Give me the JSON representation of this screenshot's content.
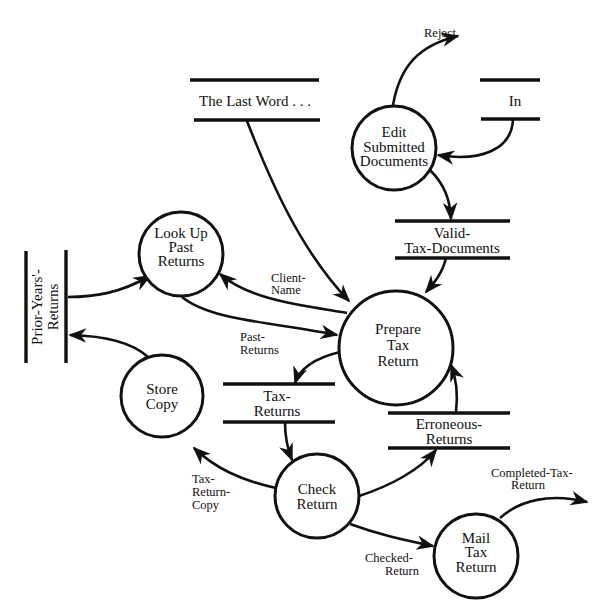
{
  "diagram": {
    "type": "data-flow-diagram",
    "processes": [
      {
        "id": "edit",
        "lines": [
          "Edit",
          "Submitted",
          "Documents"
        ]
      },
      {
        "id": "lookup",
        "lines": [
          "Look Up",
          "Past",
          "Returns"
        ]
      },
      {
        "id": "prepare",
        "lines": [
          "Prepare",
          "Tax",
          "Return"
        ]
      },
      {
        "id": "store",
        "lines": [
          "Store",
          "Copy"
        ]
      },
      {
        "id": "check",
        "lines": [
          "Check",
          "Return"
        ]
      },
      {
        "id": "mail",
        "lines": [
          "Mail",
          "Tax",
          "Return"
        ]
      }
    ],
    "stores": [
      {
        "id": "lastword",
        "lines": [
          "The Last Word . . ."
        ]
      },
      {
        "id": "in",
        "lines": [
          "In"
        ]
      },
      {
        "id": "valid",
        "lines": [
          "Valid-",
          "Tax-Documents"
        ]
      },
      {
        "id": "prior",
        "lines": [
          "Prior-Years'-",
          "Returns"
        ]
      },
      {
        "id": "taxreturns",
        "lines": [
          "Tax-",
          "Returns"
        ]
      },
      {
        "id": "erroneous",
        "lines": [
          "Erroneous-",
          "Returns"
        ]
      }
    ],
    "flows": [
      {
        "id": "reject",
        "lines": [
          "Reject"
        ],
        "from": "edit",
        "to": "external"
      },
      {
        "id": "in_to_edit",
        "lines": [],
        "from": "in",
        "to": "edit"
      },
      {
        "id": "edit_to_valid",
        "lines": [],
        "from": "edit",
        "to": "valid"
      },
      {
        "id": "valid_to_prepare",
        "lines": [],
        "from": "valid",
        "to": "prepare"
      },
      {
        "id": "lastword_to_prepare",
        "lines": [],
        "from": "lastword",
        "to": "prepare"
      },
      {
        "id": "client_name",
        "lines": [
          "Client-",
          "Name"
        ],
        "from": "prepare",
        "to": "lookup"
      },
      {
        "id": "past_returns",
        "lines": [
          "Past-",
          "Returns"
        ],
        "from": "lookup",
        "to": "prepare"
      },
      {
        "id": "prior_to_lookup",
        "lines": [],
        "from": "prior",
        "to": "lookup"
      },
      {
        "id": "store_to_prior",
        "lines": [],
        "from": "store",
        "to": "prior"
      },
      {
        "id": "prepare_to_taxreturns",
        "lines": [],
        "from": "prepare",
        "to": "taxreturns"
      },
      {
        "id": "taxreturns_to_check",
        "lines": [],
        "from": "taxreturns",
        "to": "check"
      },
      {
        "id": "tax_return_copy",
        "lines": [
          "Tax-",
          "Return-",
          "Copy"
        ],
        "from": "check",
        "to": "store"
      },
      {
        "id": "check_to_erroneous",
        "lines": [],
        "from": "check",
        "to": "erroneous"
      },
      {
        "id": "erroneous_to_prepare",
        "lines": [],
        "from": "erroneous",
        "to": "prepare"
      },
      {
        "id": "checked_return",
        "lines": [
          "Checked-",
          "Return"
        ],
        "from": "check",
        "to": "mail"
      },
      {
        "id": "completed_tax_return",
        "lines": [
          "Completed-Tax-",
          "Return"
        ],
        "from": "mail",
        "to": "external"
      }
    ]
  },
  "labels": {
    "edit": [
      "Edit",
      "Submitted",
      "Documents"
    ],
    "lookup": [
      "Look Up",
      "Past",
      "Returns"
    ],
    "prepare": [
      "Prepare",
      "Tax",
      "Return"
    ],
    "store": [
      "Store",
      "Copy"
    ],
    "check": [
      "Check",
      "Return"
    ],
    "mail": [
      "Mail",
      "Tax",
      "Return"
    ],
    "lastword": "The Last Word . . .",
    "in": "In",
    "valid": [
      "Valid-",
      "Tax-Documents"
    ],
    "prior": [
      "Prior-Years'-",
      "Returns"
    ],
    "taxreturns": [
      "Tax-",
      "Returns"
    ],
    "erroneous": [
      "Erroneous-",
      "Returns"
    ],
    "reject": "Reject",
    "client_name": [
      "Client-",
      "Name"
    ],
    "past_returns": [
      "Past-",
      "Returns"
    ],
    "tax_return_copy": [
      "Tax-",
      "Return-",
      "Copy"
    ],
    "checked_return": [
      "Checked-",
      "Return"
    ],
    "completed_tax_return": [
      "Completed-Tax-",
      "Return"
    ]
  },
  "colors": {
    "ink": "#111111",
    "background": "#ffffff"
  }
}
